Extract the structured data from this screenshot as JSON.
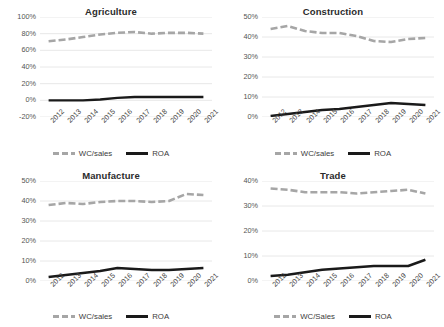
{
  "figure": {
    "panel_count": 4,
    "background": "#ffffff"
  },
  "colors": {
    "wc_sales": "#a6a6a6",
    "roa": "#1a1a1a",
    "gridline": "#e2e2e2",
    "text": "#3b3b3b"
  },
  "chart_data": [
    {
      "type": "line",
      "title": "Agriculture",
      "xlabel": "",
      "ylabel": "",
      "x": [
        "2012",
        "2013",
        "2014",
        "2015",
        "2016",
        "2017",
        "2018",
        "2019",
        "2020",
        "2021"
      ],
      "categories": [
        "2012",
        "2013",
        "2014",
        "2015",
        "2016",
        "2017",
        "2018",
        "2019",
        "2020",
        "2021"
      ],
      "yticks": [
        "-20%",
        "0%",
        "20%",
        "40%",
        "60%",
        "80%",
        "100%"
      ],
      "ytick_values": [
        -20,
        0,
        20,
        40,
        60,
        80,
        100
      ],
      "ylim": [
        -20,
        100
      ],
      "grid": true,
      "legend_position": "bottom",
      "series": [
        {
          "name": "WC/sales",
          "style": "dashed",
          "color": "#a6a6a6",
          "values": [
            71,
            73,
            76,
            79,
            81,
            82,
            80,
            81,
            81,
            80
          ]
        },
        {
          "name": "ROA",
          "style": "solid",
          "color": "#1a1a1a",
          "values": [
            0,
            0,
            0,
            1,
            3,
            4,
            4,
            4,
            4,
            4
          ]
        }
      ]
    },
    {
      "type": "line",
      "title": "Construction",
      "xlabel": "",
      "ylabel": "",
      "x": [
        "2012",
        "2013",
        "2014",
        "2015",
        "2016",
        "2017",
        "2018",
        "2019",
        "2020",
        "2021"
      ],
      "categories": [
        "2012",
        "2013",
        "2014",
        "2015",
        "2016",
        "2017",
        "2018",
        "2019",
        "2020",
        "2021"
      ],
      "yticks": [
        "0%",
        "10%",
        "20%",
        "30%",
        "40%",
        "50%"
      ],
      "ytick_values": [
        0,
        10,
        20,
        30,
        40,
        50
      ],
      "ylim": [
        0,
        50
      ],
      "grid": true,
      "legend_position": "bottom",
      "series": [
        {
          "name": "WC/sales",
          "style": "dashed",
          "color": "#a6a6a6",
          "values": [
            44,
            45.5,
            43,
            42,
            42,
            40.5,
            38,
            37.5,
            39,
            39.5
          ]
        },
        {
          "name": "ROA",
          "style": "solid",
          "color": "#1a1a1a",
          "values": [
            0.5,
            1.5,
            2.5,
            3.5,
            4,
            5,
            6,
            7,
            6.5,
            6
          ]
        }
      ]
    },
    {
      "type": "line",
      "title": "Manufacture",
      "xlabel": "",
      "ylabel": "",
      "x": [
        "2012",
        "2013",
        "2014",
        "2015",
        "2016",
        "2017",
        "2018",
        "2019",
        "2020",
        "2021"
      ],
      "categories": [
        "2012",
        "2013",
        "2014",
        "2015",
        "2016",
        "2017",
        "2018",
        "2019",
        "2020",
        "2021"
      ],
      "yticks": [
        "0%",
        "10%",
        "20%",
        "30%",
        "40%",
        "50%"
      ],
      "ytick_values": [
        0,
        10,
        20,
        30,
        40,
        50
      ],
      "ylim": [
        0,
        50
      ],
      "grid": true,
      "legend_position": "bottom",
      "series": [
        {
          "name": "WC/sales",
          "style": "dashed",
          "color": "#a6a6a6",
          "values": [
            38,
            39,
            38.5,
            39.5,
            40,
            40,
            39.5,
            40,
            43.5,
            43
          ]
        },
        {
          "name": "ROA",
          "style": "solid",
          "color": "#1a1a1a",
          "values": [
            2,
            3,
            4,
            5,
            6.5,
            6,
            5.5,
            5.5,
            6,
            6.5
          ]
        }
      ]
    },
    {
      "type": "line",
      "title": "Trade",
      "xlabel": "",
      "ylabel": "",
      "x": [
        "2012",
        "2013",
        "2014",
        "2015",
        "2016",
        "2017",
        "2018",
        "2019",
        "2020",
        "2021"
      ],
      "categories": [
        "2012",
        "2013",
        "2014",
        "2015",
        "2016",
        "2017",
        "2018",
        "2019",
        "2020",
        "2021"
      ],
      "yticks": [
        "0%",
        "10%",
        "20%",
        "30%",
        "40%"
      ],
      "ytick_values": [
        0,
        10,
        20,
        30,
        40
      ],
      "ylim": [
        0,
        40
      ],
      "grid": true,
      "legend_position": "bottom",
      "series": [
        {
          "name": "WC/Sales",
          "style": "dashed",
          "color": "#a6a6a6",
          "values": [
            37,
            36.5,
            35.5,
            35.5,
            35.5,
            35,
            35.5,
            36,
            36.5,
            35
          ]
        },
        {
          "name": "ROA",
          "style": "solid",
          "color": "#1a1a1a",
          "values": [
            2,
            2.5,
            3.5,
            4.5,
            5,
            5.5,
            6,
            6,
            6,
            8.5
          ]
        }
      ]
    }
  ]
}
